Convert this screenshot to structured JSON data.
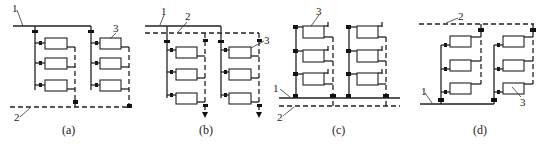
{
  "figure": {
    "legend_numbers": {
      "supply_pipe": "1",
      "return_pipe": "2",
      "radiator": "3"
    },
    "panels": [
      {
        "id": "a",
        "caption": "(a)",
        "labels": [
          "1",
          "2",
          "3"
        ],
        "supply": "top",
        "return": "bottom"
      },
      {
        "id": "b",
        "caption": "(b)",
        "labels": [
          "1",
          "2",
          "3"
        ],
        "supply": "top",
        "return": "top"
      },
      {
        "id": "c",
        "caption": "(c)",
        "labels": [
          "1",
          "2",
          "3"
        ],
        "supply": "bottom",
        "return": "bottom"
      },
      {
        "id": "d",
        "caption": "(d)",
        "labels": [
          "1",
          "2",
          "3"
        ],
        "supply": "bottom",
        "return": "top"
      }
    ]
  },
  "colors": {
    "line": "#222222",
    "background": "#ffffff"
  }
}
